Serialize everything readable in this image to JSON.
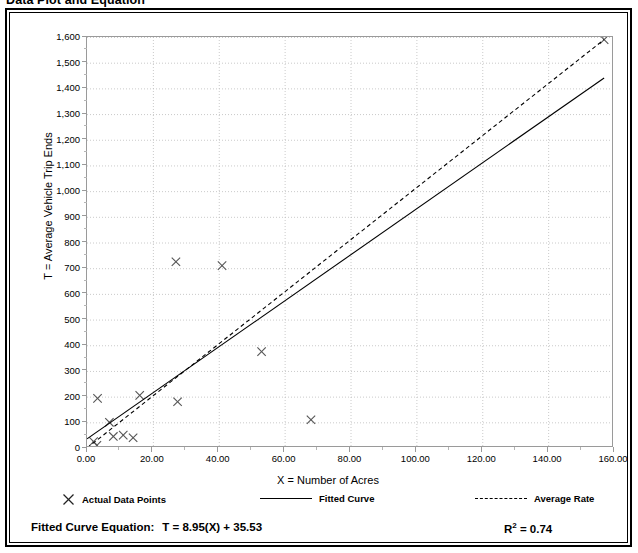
{
  "title": "Data Plot and Equation",
  "axes": {
    "y_title": "T = Average Vehicle Trip Ends",
    "x_title": "X = Number of Acres",
    "y_ticks": [
      "0",
      "100",
      "200",
      "300",
      "400",
      "500",
      "600",
      "700",
      "800",
      "900",
      "1,000",
      "1,100",
      "1,200",
      "1,300",
      "1,400",
      "1,500",
      "1,600"
    ],
    "x_ticks": [
      "0.00",
      "20.00",
      "40.00",
      "60.00",
      "80.00",
      "100.00",
      "120.00",
      "140.00",
      "160.00"
    ]
  },
  "legend": {
    "items": [
      {
        "label": "Actual Data Points",
        "marker": "x-marker-icon"
      },
      {
        "label": "Fitted Curve",
        "marker": "solid-line-icon"
      },
      {
        "label": "Average Rate",
        "marker": "dashed-line-icon"
      }
    ]
  },
  "equation": {
    "label": "Fitted Curve Equation:",
    "value": "T = 8.95(X) + 35.53",
    "r2_prefix": "R",
    "r2_exp": "2",
    "r2_value": " = 0.74"
  },
  "chart_data": {
    "type": "scatter",
    "title": "Data Plot and Equation",
    "xlabel": "X = Number of Acres",
    "ylabel": "T = Average Vehicle Trip Ends",
    "xlim": [
      0,
      160
    ],
    "ylim": [
      0,
      1600
    ],
    "x_tick_step": 20,
    "y_tick_step": 100,
    "grid": true,
    "legend_position": "below-plot",
    "series": [
      {
        "name": "Actual Data Points",
        "type": "scatter",
        "marker": "x",
        "color": "#555555",
        "points": [
          [
            2.0,
            25
          ],
          [
            3.0,
            10
          ],
          [
            3.2,
            193
          ],
          [
            6.8,
            100
          ],
          [
            8.0,
            45
          ],
          [
            11.0,
            50
          ],
          [
            14.0,
            40
          ],
          [
            16.0,
            205
          ],
          [
            27.5,
            180
          ],
          [
            27.0,
            725
          ],
          [
            41.0,
            710
          ],
          [
            53.0,
            375
          ],
          [
            68.0,
            110
          ],
          [
            157.0,
            1590
          ]
        ]
      },
      {
        "name": "Fitted Curve",
        "type": "line",
        "style": "solid",
        "color": "#000000",
        "equation": "T = 8.95(X) + 35.53",
        "slope": 8.95,
        "intercept": 35.53,
        "r_squared": 0.74,
        "endpoints": [
          [
            0,
            35.53
          ],
          [
            157,
            1440.68
          ]
        ]
      },
      {
        "name": "Average Rate",
        "type": "line",
        "style": "dashed",
        "color": "#000000",
        "slope": 10.13,
        "intercept": 0,
        "endpoints": [
          [
            0,
            0
          ],
          [
            157,
            1590
          ]
        ]
      }
    ]
  },
  "colors": {
    "border": "#000000",
    "grid": "#bdbdbd",
    "axis": "#9a9a9a",
    "marker": "#555555",
    "plot_bg": "#ffffff"
  }
}
